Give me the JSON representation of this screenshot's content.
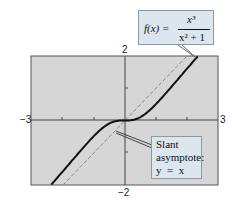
{
  "chart_data": {
    "type": "line",
    "title": "",
    "xlabel": "",
    "ylabel": "",
    "xlim": [
      -3,
      3
    ],
    "ylim": [
      -2,
      2
    ],
    "grid": false,
    "tick_labels": {
      "x_min": "−3",
      "x_max": "3",
      "y_min": "−2",
      "y_max": "2"
    },
    "series": [
      {
        "name": "f(x) = x^3/(x^2 + 1)",
        "style": "solid",
        "color": "#111111",
        "x": [
          -2.4,
          -2,
          -1.5,
          -1,
          -0.5,
          0,
          0.5,
          1,
          1.5,
          2,
          2.4
        ],
        "y": [
          -2.05,
          -1.6,
          -1.04,
          -0.5,
          -0.1,
          0,
          0.1,
          0.5,
          1.04,
          1.6,
          2.05
        ]
      },
      {
        "name": "Slant asymptote: y = x",
        "style": "dashed",
        "color": "#888888",
        "x": [
          -2,
          2
        ],
        "y": [
          -2,
          2
        ]
      }
    ],
    "annotations": [
      {
        "text": "f(x) = x^3/(x^2 + 1)",
        "points_to": "curve upper right"
      },
      {
        "text": "Slant asymptote: y = x",
        "points_to": "dashed line"
      }
    ]
  },
  "labels": {
    "x_min": "−3",
    "x_max": "3",
    "y_min": "−2",
    "y_max": "2",
    "func_lhs": "f(x) =",
    "func_num": "x³",
    "func_den": "x² + 1",
    "slant_line1": "Slant",
    "slant_line2": "asymptote:",
    "slant_line3": "y  =  x"
  }
}
